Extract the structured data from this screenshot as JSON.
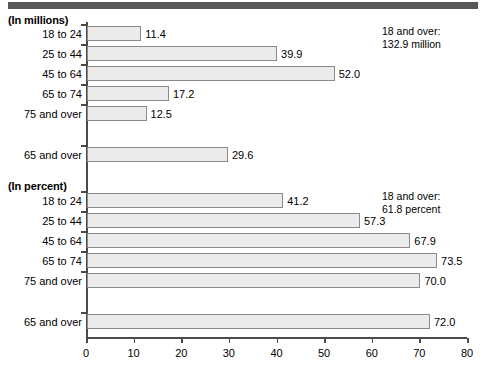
{
  "chart_data": {
    "type": "bar",
    "title": "",
    "orientation": "horizontal",
    "xlabel": "",
    "ylabel": "",
    "xlim": [
      0,
      80
    ],
    "xticks": [
      0,
      10,
      20,
      30,
      40,
      50,
      60,
      70,
      80
    ],
    "grid": false,
    "legend": "none",
    "sections": [
      {
        "caption": "(In millions)",
        "units": "millions",
        "annotation_line1": "18 and over:",
        "annotation_line2": "132.9 million",
        "categories": [
          "18 to 24",
          "25 to 44",
          "45 to 64",
          "65 to 74",
          "75 and over"
        ],
        "values": [
          11.4,
          39.9,
          52.0,
          17.2,
          12.5
        ],
        "value_labels": [
          "11.4",
          "39.9",
          "52.0",
          "17.2",
          "12.5"
        ],
        "summary": {
          "category": "65 and over",
          "value": 29.6,
          "value_label": "29.6"
        }
      },
      {
        "caption": "(In percent)",
        "units": "percent",
        "annotation_line1": "18 and over:",
        "annotation_line2": "61.8 percent",
        "categories": [
          "18 to 24",
          "25 to 44",
          "45 to 64",
          "65 to 74",
          "75 and over"
        ],
        "values": [
          41.2,
          57.3,
          67.9,
          73.5,
          70.0
        ],
        "value_labels": [
          "41.2",
          "57.3",
          "67.9",
          "73.5",
          "70.0"
        ],
        "summary": {
          "category": "65 and over",
          "value": 72.0,
          "value_label": "72.0"
        }
      }
    ]
  },
  "colors": {
    "bar_fill": "#ebebeb",
    "bar_border": "#8a8a8a",
    "axis": "#4a4a4a",
    "header_rule": "#575757",
    "text": "#000000",
    "background": "#ffffff"
  }
}
